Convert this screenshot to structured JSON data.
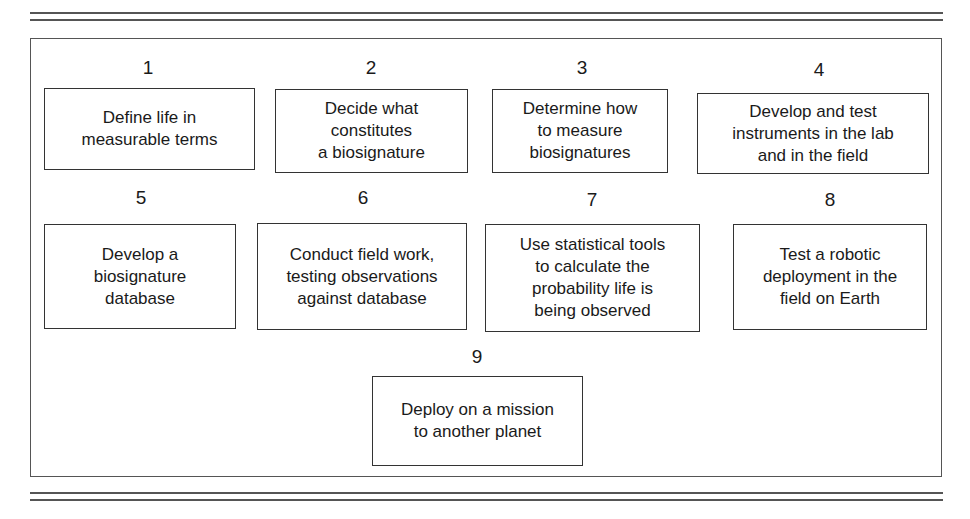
{
  "diagram": {
    "steps": [
      {
        "number": "1",
        "text": "Define life in\nmeasurable terms"
      },
      {
        "number": "2",
        "text": "Decide what\nconstitutes\na biosignature"
      },
      {
        "number": "3",
        "text": "Determine how\nto  measure\nbiosignatures"
      },
      {
        "number": "4",
        "text": "Develop and test\ninstruments in the lab\nand in the field"
      },
      {
        "number": "5",
        "text": "Develop a\nbiosignature\ndatabase"
      },
      {
        "number": "6",
        "text": "Conduct field work,\ntesting observations\nagainst database"
      },
      {
        "number": "7",
        "text": "Use statistical tools\nto calculate the\nprobability life is\nbeing observed"
      },
      {
        "number": "8",
        "text": "Test a robotic\ndeployment in the\nfield on Earth"
      },
      {
        "number": "9",
        "text": "Deploy on a mission\nto another planet"
      }
    ]
  },
  "colors": {
    "line": "#555555",
    "box_border": "#333333",
    "text": "#1a1a1a",
    "background": "#ffffff"
  }
}
